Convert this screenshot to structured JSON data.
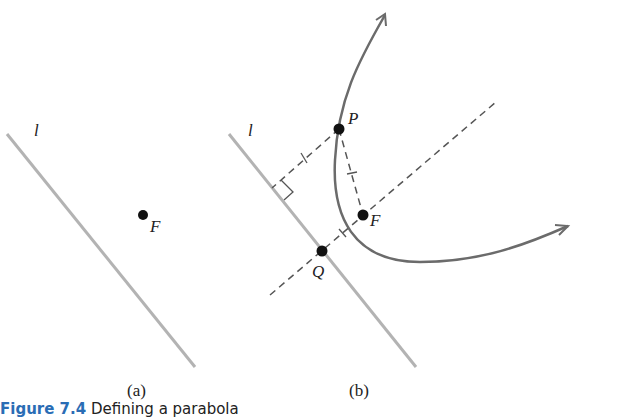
{
  "figure": {
    "caption_label": "Figure 7.4",
    "caption_text": " Defining a parabola",
    "panel_a": {
      "sublabel": "(a)",
      "line_label": "l",
      "focus_label": "F"
    },
    "panel_b": {
      "sublabel": "(b)",
      "line_label": "l",
      "point_p_label": "P",
      "focus_label": "F",
      "point_q_label": "Q"
    },
    "colors": {
      "directrix": "#b3b3b3",
      "curve": "#6b6b6b",
      "dashed": "#555555",
      "points": "#111111",
      "caption_label": "#2a6db5"
    }
  }
}
